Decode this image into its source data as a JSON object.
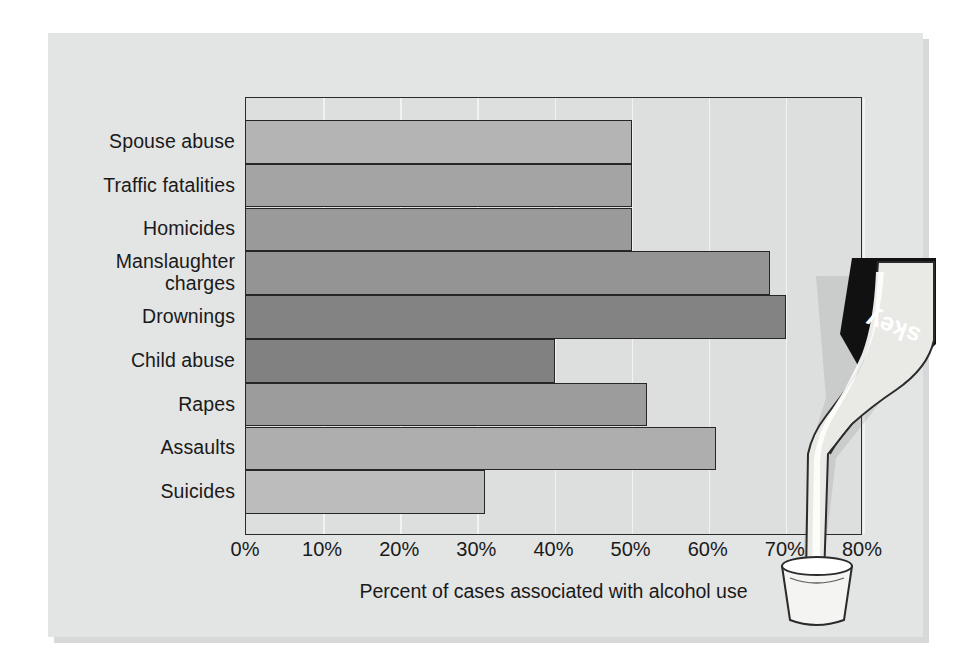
{
  "figure": {
    "background_color": "#ffffff",
    "panel_color": "#e3e4e4",
    "plot_background_color": "#dddede",
    "axis_color": "#2b2b2b",
    "gridline_color": "#f2f2f2",
    "text_color": "#1a1a1a"
  },
  "illustration": {
    "name": "whiskey-bottle-pouring-into-glass",
    "bottle_label_text": "skey",
    "bottle_label_color": "#111111",
    "bottle_body_color": "#ebebe8",
    "glass_color": "#f4f4f2",
    "outline_color": "#2b2b2b",
    "description": "Inverted whiskey bottle pouring a stream into a tumbler glass"
  },
  "chart_data": {
    "type": "bar",
    "orientation": "horizontal",
    "title": "",
    "xlabel": "Percent of cases associated with alcohol use",
    "ylabel": "",
    "xlim": [
      0,
      80
    ],
    "ylim": null,
    "grid": true,
    "grid_axis": "x",
    "legend": null,
    "xticks": [
      0,
      10,
      20,
      30,
      40,
      50,
      60,
      70,
      80
    ],
    "xtick_labels": [
      "0%",
      "10%",
      "20%",
      "30%",
      "40%",
      "50%",
      "60%",
      "70%",
      "80%"
    ],
    "categories": [
      "Spouse abuse",
      "Traffic fatalities",
      "Homicides",
      "Manslaughter charges",
      "Drownings",
      "Child abuse",
      "Rapes",
      "Assaults",
      "Suicides"
    ],
    "category_labels": [
      {
        "line1": "Spouse abuse",
        "line2": ""
      },
      {
        "line1": "Traffic fatalities",
        "line2": ""
      },
      {
        "line1": "Homicides",
        "line2": ""
      },
      {
        "line1": "Manslaughter",
        "line2": "charges"
      },
      {
        "line1": "Drownings",
        "line2": ""
      },
      {
        "line1": "Child abuse",
        "line2": ""
      },
      {
        "line1": "Rapes",
        "line2": ""
      },
      {
        "line1": "Assaults",
        "line2": ""
      },
      {
        "line1": "Suicides",
        "line2": ""
      }
    ],
    "values": [
      50,
      50,
      50,
      68,
      70,
      40,
      52,
      61,
      31
    ],
    "bar_colors": [
      "#b4b4b4",
      "#a4a4a4",
      "#9a9a9a",
      "#949494",
      "#838383",
      "#818181",
      "#9c9c9c",
      "#aeaeae",
      "#bcbcbc"
    ],
    "bar_edge_color": "#262626",
    "units": "percent"
  }
}
